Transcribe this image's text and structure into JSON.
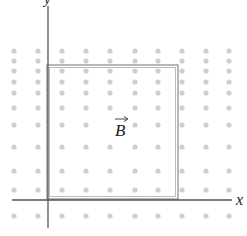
{
  "diagram": {
    "type": "physics-magnetic-field-loop",
    "axes": {
      "x_label": "x",
      "y_label": "y"
    },
    "field": {
      "label": "B",
      "vector_arrow": true,
      "direction": "out-of-page",
      "dot_color": "#c8c8c8"
    },
    "loop": {
      "shape": "square",
      "stroke_color": "#8a8a8a"
    },
    "dot_grid": {
      "columns_x": [
        14,
        38,
        62,
        86,
        110,
        135,
        158,
        182,
        206,
        229
      ],
      "rows_y": [
        51,
        61,
        71,
        82,
        93,
        108,
        125,
        147,
        171,
        190,
        216
      ]
    },
    "colors": {
      "axis": "#555555",
      "loop": "#8a8a8a",
      "dots": "#cfcfcf",
      "text": "#222222"
    }
  }
}
